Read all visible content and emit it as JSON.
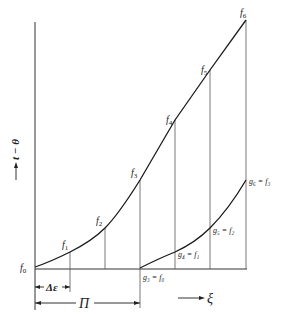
{
  "diagram": {
    "y_axis_label": "t − θ",
    "x_axis_label": "ξ",
    "delta_label": "Δε",
    "period_label": "Π",
    "upper_points": [
      {
        "name": "f",
        "sub": "0",
        "x": 35,
        "y": 267
      },
      {
        "name": "f",
        "sub": "1",
        "x": 70,
        "y": 252
      },
      {
        "name": "f",
        "sub": "2",
        "x": 105,
        "y": 228
      },
      {
        "name": "f",
        "sub": "3",
        "x": 140,
        "y": 180
      },
      {
        "name": "f",
        "sub": "4",
        "x": 175,
        "y": 120
      },
      {
        "name": "f",
        "sub": "5",
        "x": 210,
        "y": 70
      },
      {
        "name": "f",
        "sub": "6",
        "x": 246,
        "y": 20
      }
    ],
    "lower_points": [
      {
        "label": "g₃ = f₀",
        "x": 140,
        "y": 268
      },
      {
        "label": "g₄ = f₁",
        "x": 175,
        "y": 252
      },
      {
        "label": "g₅ = f₂",
        "x": 210,
        "y": 228
      },
      {
        "label": "g₆ = f₃",
        "x": 246,
        "y": 180
      }
    ],
    "labels": {
      "f0": "f",
      "f0_sub": "0",
      "f1": "f",
      "f1_sub": "1",
      "f2": "f",
      "f2_sub": "2",
      "f3": "f",
      "f3_sub": "3",
      "f4": "f",
      "f4_sub": "4",
      "f5": "f",
      "f5_sub": "5",
      "f6": "f",
      "f6_sub": "6",
      "g3": "g₃ = f₀",
      "g4": "g₄ = f₁",
      "g5": "g₅ = f₂",
      "g6": "g₆ = f₃"
    }
  }
}
